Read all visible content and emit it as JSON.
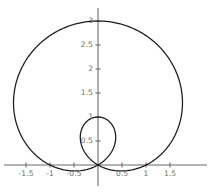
{
  "chart_data": {
    "type": "line",
    "title": "",
    "subtitle": "",
    "xlabel": "",
    "ylabel": "",
    "plot_kind": "polar-limacon",
    "equation": "r = 1 + 2 sin(theta)",
    "grid": false,
    "legend": null,
    "axes_style": "centered-cross",
    "xlim": [
      -1.95,
      2.1
    ],
    "ylim": [
      -0.2,
      3.15
    ],
    "xticks": [
      -1.5,
      -1,
      -0.5,
      0.5,
      1,
      1.5
    ],
    "xticklabels": [
      "-1.5",
      "-1",
      "-0.5",
      "0.5",
      "1",
      "1.5"
    ],
    "yticks": [
      0.5,
      1,
      1.5,
      2,
      2.5,
      3
    ],
    "yticklabels": [
      "0.5",
      "1",
      "1.5",
      "2",
      "2.5",
      "3"
    ],
    "curve_color": "#1a1a1a",
    "axis_color": "#6b6b6b",
    "background_color": "#ffffff",
    "features": {
      "outer_loop_top_y": 3,
      "outer_loop_x_min": -1.76,
      "outer_loop_x_max": 1.76,
      "inner_loop_top_y": 1,
      "inner_loop_x_min": -0.36,
      "inner_loop_x_max": 0.36,
      "node_point": [
        0,
        0
      ]
    },
    "series": [
      {
        "name": "r = 1 + 2 sin(theta)",
        "theta_start_deg": 0,
        "theta_end_deg": 360,
        "samples": 720,
        "values": [
          {
            "theta_deg": 0,
            "r": 1.0,
            "x": 1.0,
            "y": 0.0
          },
          {
            "theta_deg": 15,
            "r": 1.518,
            "x": 1.466,
            "y": 0.393
          },
          {
            "theta_deg": 30,
            "r": 2.0,
            "x": 1.732,
            "y": 1.0
          },
          {
            "theta_deg": 45,
            "r": 2.414,
            "x": 1.707,
            "y": 1.707
          },
          {
            "theta_deg": 60,
            "r": 2.732,
            "x": 1.366,
            "y": 2.366
          },
          {
            "theta_deg": 75,
            "r": 2.932,
            "x": 0.759,
            "y": 2.832
          },
          {
            "theta_deg": 90,
            "r": 3.0,
            "x": 0.0,
            "y": 3.0
          },
          {
            "theta_deg": 105,
            "r": 2.932,
            "x": -0.759,
            "y": 2.832
          },
          {
            "theta_deg": 120,
            "r": 2.732,
            "x": -1.366,
            "y": 2.366
          },
          {
            "theta_deg": 135,
            "r": 2.414,
            "x": -1.707,
            "y": 1.707
          },
          {
            "theta_deg": 150,
            "r": 2.0,
            "x": -1.732,
            "y": 1.0
          },
          {
            "theta_deg": 165,
            "r": 1.518,
            "x": -1.466,
            "y": 0.393
          },
          {
            "theta_deg": 180,
            "r": 1.0,
            "x": -1.0,
            "y": 0.0
          },
          {
            "theta_deg": 195,
            "r": 0.482,
            "x": -0.466,
            "y": -0.125
          },
          {
            "theta_deg": 210,
            "r": 0.0,
            "x": 0.0,
            "y": 0.0
          },
          {
            "theta_deg": 225,
            "r": -0.414,
            "x": 0.293,
            "y": 0.293
          },
          {
            "theta_deg": 240,
            "r": -0.732,
            "x": 0.366,
            "y": 0.634
          },
          {
            "theta_deg": 255,
            "r": -0.932,
            "x": 0.241,
            "y": 0.9
          },
          {
            "theta_deg": 270,
            "r": -1.0,
            "x": 0.0,
            "y": 1.0
          },
          {
            "theta_deg": 285,
            "r": -0.932,
            "x": -0.241,
            "y": 0.9
          },
          {
            "theta_deg": 300,
            "r": -0.732,
            "x": -0.366,
            "y": 0.634
          },
          {
            "theta_deg": 315,
            "r": -0.414,
            "x": -0.293,
            "y": 0.293
          },
          {
            "theta_deg": 330,
            "r": 0.0,
            "x": 0.0,
            "y": 0.0
          },
          {
            "theta_deg": 345,
            "r": 0.482,
            "x": 0.466,
            "y": -0.125
          },
          {
            "theta_deg": 360,
            "r": 1.0,
            "x": 1.0,
            "y": 0.0
          }
        ]
      }
    ]
  },
  "plot": {
    "origin_px": {
      "x": 98,
      "y": 165
    },
    "scale_px_per_unit": 48,
    "x_tick_labels": [
      {
        "value": -1.5,
        "text": "-1.5"
      },
      {
        "value": -1,
        "text": "-1"
      },
      {
        "value": -0.5,
        "text": "-0.5"
      },
      {
        "value": 0.5,
        "text": "0.5"
      },
      {
        "value": 1,
        "text": "1"
      },
      {
        "value": 1.5,
        "text": "1.5"
      }
    ],
    "y_tick_labels": [
      {
        "value": 0.5,
        "text": "0.5"
      },
      {
        "value": 1,
        "text": "1"
      },
      {
        "value": 1.5,
        "text": "1.5"
      },
      {
        "value": 2,
        "text": "2"
      },
      {
        "value": 2.5,
        "text": "2.5"
      },
      {
        "value": 3,
        "text": "3"
      }
    ]
  }
}
